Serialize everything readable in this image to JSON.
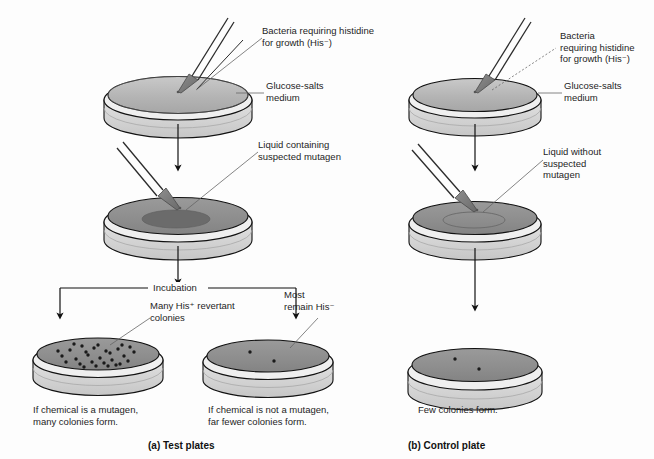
{
  "figure": {
    "background": "#fdfdfd"
  },
  "colors": {
    "outline": "#111111",
    "medium_top_light": "#b9b9b9",
    "medium_top_dark": "#8f8f8f",
    "mutagen_spot": "#6e6e6e",
    "dish_wall": "#d8d8d8",
    "dish_wall_shade": "#c2c2c2",
    "pipette": "#7a7a7a",
    "leader_line": "#555555",
    "colony": "#1a1a1a"
  },
  "panels": [
    {
      "id": "a",
      "label": "(a) Test plates"
    },
    {
      "id": "b",
      "label": "(b) Control plate"
    }
  ],
  "labels": {
    "bacteria_left": "Bacteria requiring histidine\nfor growth (His⁻)",
    "bacteria_right": "Bacteria\nrequiring histidine\nfor growth (His⁻)",
    "glucose_salts_left": "Glucose-salts\nmedium",
    "glucose_salts_right": "Glucose-salts\nmedium",
    "liquid_with_mutagen": "Liquid containing\nsuspected mutagen",
    "liquid_without_mutagen": "Liquid without\nsuspected\nmutagen",
    "incubation": "Incubation",
    "many_revertant": "Many His⁺ revertant\ncolonies",
    "most_remain": "Most\nremain His⁻"
  },
  "captions": {
    "mutagen_positive": "If chemical is a mutagen,\nmany colonies form.",
    "mutagen_negative": "If chemical is not a mutagen,\nfar fewer colonies form.",
    "control_result": "Few colonies form."
  },
  "plates": {
    "test_top": {
      "name": "test-plate-inoculation",
      "colonies": 0,
      "has_mutagen_spot": false
    },
    "test_middle": {
      "name": "test-plate-mutagen",
      "colonies": 0,
      "has_mutagen_spot": true
    },
    "test_many": {
      "name": "test-plate-many-colonies",
      "colonies": 29,
      "has_mutagen_spot": false
    },
    "test_few": {
      "name": "test-plate-few-colonies",
      "colonies": 2,
      "has_mutagen_spot": false
    },
    "control_top": {
      "name": "control-plate-inoculation",
      "colonies": 0,
      "has_mutagen_spot": false
    },
    "control_middle": {
      "name": "control-plate-liquid",
      "colonies": 0,
      "has_mutagen_spot": true
    },
    "control_result": {
      "name": "control-plate-result",
      "colonies": 2,
      "has_mutagen_spot": false
    }
  },
  "colony_points": {
    "test_many": [
      [
        -36,
        2
      ],
      [
        -28,
        -4
      ],
      [
        -22,
        5
      ],
      [
        -16,
        -8
      ],
      [
        -10,
        1
      ],
      [
        -4,
        -6
      ],
      [
        2,
        4
      ],
      [
        8,
        -3
      ],
      [
        14,
        6
      ],
      [
        20,
        -5
      ],
      [
        26,
        2
      ],
      [
        32,
        -7
      ],
      [
        -32,
        8
      ],
      [
        -24,
        -10
      ],
      [
        -18,
        10
      ],
      [
        -12,
        -2
      ],
      [
        -6,
        8
      ],
      [
        0,
        -9
      ],
      [
        6,
        9
      ],
      [
        12,
        -1
      ],
      [
        18,
        11
      ],
      [
        24,
        -9
      ],
      [
        30,
        7
      ],
      [
        -40,
        -3
      ],
      [
        36,
        -2
      ],
      [
        -2,
        12
      ],
      [
        10,
        12
      ],
      [
        -14,
        13
      ],
      [
        22,
        10
      ]
    ],
    "test_few": [
      [
        -18,
        -4
      ],
      [
        6,
        5
      ]
    ],
    "control_result": [
      [
        -20,
        -6
      ],
      [
        4,
        4
      ]
    ]
  }
}
